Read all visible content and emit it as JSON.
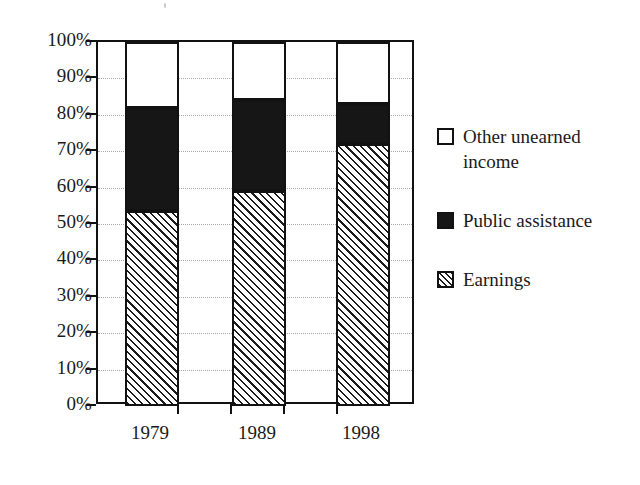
{
  "chart_data": {
    "type": "bar",
    "stacked": true,
    "normalized_percent": true,
    "title": "",
    "subtitle": "",
    "xlabel": "",
    "ylabel": "",
    "categories": [
      "1979",
      "1989",
      "1998"
    ],
    "ylim": [
      0,
      100
    ],
    "ytick_labels": [
      "0%",
      "10%",
      "20%",
      "30%",
      "40%",
      "50%",
      "60%",
      "70%",
      "80%",
      "90%",
      "100%"
    ],
    "ytick_values": [
      0,
      10,
      20,
      30,
      40,
      50,
      60,
      70,
      80,
      90,
      100
    ],
    "grid": "horizontal-dotted",
    "legend_position": "right",
    "series": [
      {
        "name": "Earnings",
        "pattern": "diagonal-hatch",
        "color": "#ffffff",
        "values": [
          53.5,
          59.0,
          72.0
        ]
      },
      {
        "name": "Public assistance",
        "pattern": "solid-black",
        "color": "#161616",
        "values": [
          28.5,
          25.0,
          11.0
        ]
      },
      {
        "name": "Other unearned income",
        "pattern": "solid-white",
        "color": "#ffffff",
        "values": [
          18.0,
          16.0,
          17.0
        ]
      }
    ],
    "cumulative_tops": {
      "earnings": [
        53.5,
        59.0,
        72.0
      ],
      "public_assistance": [
        82.0,
        84.0,
        83.0
      ],
      "other_unearned_income": [
        100.0,
        100.0,
        100.0
      ]
    }
  },
  "axis": {
    "y_labels": [
      "100%",
      "90%",
      "80%",
      "70%",
      "60%",
      "50%",
      "40%",
      "30%",
      "20%",
      "10%",
      "0%"
    ],
    "x_labels": [
      "1979",
      "1989",
      "1998"
    ]
  },
  "legend": {
    "items": [
      {
        "label": "Other unearned income",
        "swatch": "white-square"
      },
      {
        "label": "Public assistance",
        "swatch": "black-square"
      },
      {
        "label": "Earnings",
        "swatch": "hatched-square"
      }
    ]
  }
}
